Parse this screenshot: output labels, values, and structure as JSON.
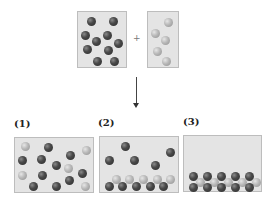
{
  "reactants": {
    "left_box": {
      "particle_type": "dark",
      "count": 10
    },
    "operator": "+",
    "right_box": {
      "particle_type": "light",
      "count": 5
    }
  },
  "arrow": "down-arrow",
  "options": [
    {
      "label": "(1)",
      "description": "mixture of dark and light particles randomly distributed"
    },
    {
      "label": "(2)",
      "description": "light particles layered on dark particles at bottom, 5 dark free particles above"
    },
    {
      "label": "(3)",
      "description": "all particles in layered structure at bottom: dark-light-dark"
    }
  ],
  "colors": {
    "box_fill": "#e4e4e4",
    "dark_particle": "#3a3a3a",
    "light_particle": "#b8b8b8"
  }
}
